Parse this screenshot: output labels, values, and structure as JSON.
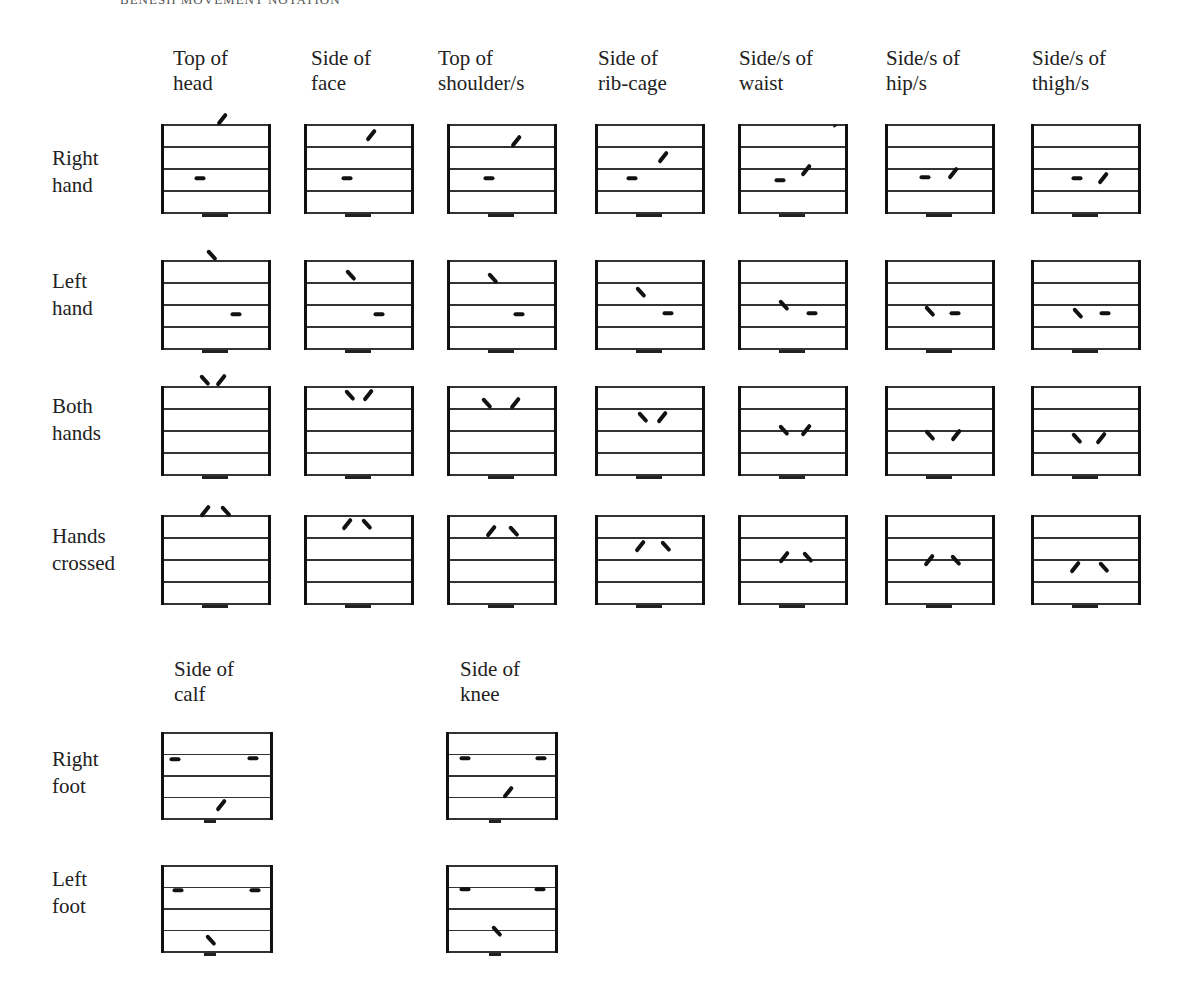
{
  "running_head": "BENESH MOVEMENT NOTATION",
  "hand_columns": [
    {
      "label": "Top of\nhead",
      "x": 162,
      "head_x": 173
    },
    {
      "label": "Side of\nface",
      "x": 305,
      "head_x": 311
    },
    {
      "label": "Top of\nshoulder/s",
      "x": 448,
      "head_x": 438
    },
    {
      "label": "Side of\nrib-cage",
      "x": 596,
      "head_x": 598
    },
    {
      "label": "Side/s of\nwaist",
      "x": 739,
      "head_x": 739
    },
    {
      "label": "Side/s of\nhip/s",
      "x": 886,
      "head_x": 886
    },
    {
      "label": "Side/s of\nthigh/s",
      "x": 1032,
      "head_x": 1032
    }
  ],
  "hand_rows": [
    {
      "label": "Right\nhand",
      "y": 125,
      "label_y": 145,
      "cells": [
        {
          "marks": [
            {
              "type": "dash",
              "x": 38,
              "y": 53
            },
            {
              "type": "slash",
              "x": 60,
              "y": -6
            }
          ]
        },
        {
          "marks": [
            {
              "type": "dash",
              "x": 42,
              "y": 53
            },
            {
              "type": "slash",
              "x": 66,
              "y": 10
            }
          ]
        },
        {
          "marks": [
            {
              "type": "dash",
              "x": 41,
              "y": 53
            },
            {
              "type": "slash",
              "x": 68,
              "y": 16
            }
          ]
        },
        {
          "marks": [
            {
              "type": "dash",
              "x": 36,
              "y": 53
            },
            {
              "type": "slash",
              "x": 67,
              "y": 32
            }
          ]
        },
        {
          "marks": [
            {
              "type": "dash",
              "x": 41,
              "y": 55
            },
            {
              "type": "slash",
              "x": 67,
              "y": 45
            },
            {
              "type": "tick",
              "x": 96,
              "y": 1
            }
          ]
        },
        {
          "marks": [
            {
              "type": "dash",
              "x": 39,
              "y": 52
            },
            {
              "type": "slash",
              "x": 67,
              "y": 48
            }
          ]
        },
        {
          "marks": [
            {
              "type": "dash",
              "x": 45,
              "y": 53
            },
            {
              "type": "slash",
              "x": 71,
              "y": 53
            }
          ]
        }
      ]
    },
    {
      "label": "Left\nhand",
      "y": 261,
      "label_y": 268,
      "cells": [
        {
          "marks": [
            {
              "type": "backslash",
              "x": 50,
              "y": -6
            },
            {
              "type": "dash",
              "x": 74,
              "y": 53
            }
          ]
        },
        {
          "marks": [
            {
              "type": "backslash",
              "x": 46,
              "y": 14
            },
            {
              "type": "dash",
              "x": 74,
              "y": 53
            }
          ]
        },
        {
          "marks": [
            {
              "type": "backslash",
              "x": 45,
              "y": 17
            },
            {
              "type": "dash",
              "x": 71,
              "y": 53
            }
          ]
        },
        {
          "marks": [
            {
              "type": "backslash",
              "x": 45,
              "y": 31
            },
            {
              "type": "dash",
              "x": 72,
              "y": 52
            }
          ]
        },
        {
          "marks": [
            {
              "type": "backslash",
              "x": 45,
              "y": 44
            },
            {
              "type": "dash",
              "x": 73,
              "y": 52
            }
          ]
        },
        {
          "marks": [
            {
              "type": "backslash",
              "x": 44,
              "y": 50
            },
            {
              "type": "dash",
              "x": 69,
              "y": 52
            }
          ]
        },
        {
          "marks": [
            {
              "type": "backslash",
              "x": 46,
              "y": 52
            },
            {
              "type": "dash",
              "x": 73,
              "y": 52
            }
          ]
        }
      ]
    },
    {
      "label": "Both\nhands",
      "y": 387,
      "label_y": 393,
      "cells": [
        {
          "marks": [
            {
              "type": "backslash",
              "x": 43,
              "y": -7
            },
            {
              "type": "slash",
              "x": 59,
              "y": -7
            }
          ]
        },
        {
          "marks": [
            {
              "type": "backslash",
              "x": 45,
              "y": 8
            },
            {
              "type": "slash",
              "x": 63,
              "y": 8
            }
          ]
        },
        {
          "marks": [
            {
              "type": "backslash",
              "x": 39,
              "y": 16
            },
            {
              "type": "slash",
              "x": 67,
              "y": 16
            }
          ]
        },
        {
          "marks": [
            {
              "type": "backslash",
              "x": 47,
              "y": 30
            },
            {
              "type": "slash",
              "x": 66,
              "y": 30
            }
          ]
        },
        {
          "marks": [
            {
              "type": "backslash",
              "x": 45,
              "y": 43
            },
            {
              "type": "slash",
              "x": 67,
              "y": 43
            }
          ]
        },
        {
          "marks": [
            {
              "type": "backslash",
              "x": 44,
              "y": 48
            },
            {
              "type": "slash",
              "x": 70,
              "y": 48
            }
          ]
        },
        {
          "marks": [
            {
              "type": "backslash",
              "x": 45,
              "y": 51
            },
            {
              "type": "slash",
              "x": 69,
              "y": 51
            }
          ]
        }
      ]
    },
    {
      "label": "Hands\ncrossed",
      "y": 516,
      "label_y": 523,
      "cells": [
        {
          "marks": [
            {
              "type": "slash",
              "x": 43,
              "y": -5
            },
            {
              "type": "backslash",
              "x": 64,
              "y": -5
            }
          ]
        },
        {
          "marks": [
            {
              "type": "slash",
              "x": 42,
              "y": 8
            },
            {
              "type": "backslash",
              "x": 62,
              "y": 8
            }
          ]
        },
        {
          "marks": [
            {
              "type": "slash",
              "x": 43,
              "y": 15
            },
            {
              "type": "backslash",
              "x": 66,
              "y": 15
            }
          ]
        },
        {
          "marks": [
            {
              "type": "slash",
              "x": 44,
              "y": 30
            },
            {
              "type": "backslash",
              "x": 70,
              "y": 30
            }
          ]
        },
        {
          "marks": [
            {
              "type": "slash",
              "x": 45,
              "y": 41
            },
            {
              "type": "backslash",
              "x": 69,
              "y": 41
            }
          ]
        },
        {
          "marks": [
            {
              "type": "slash",
              "x": 43,
              "y": 44
            },
            {
              "type": "backslash",
              "x": 70,
              "y": 44
            }
          ]
        },
        {
          "marks": [
            {
              "type": "slash",
              "x": 43,
              "y": 51
            },
            {
              "type": "backslash",
              "x": 72,
              "y": 51
            }
          ]
        }
      ]
    }
  ],
  "foot_columns": [
    {
      "label": "Side of\ncalf",
      "x": 162,
      "head_x": 174
    },
    {
      "label": "Side of\nknee",
      "x": 447,
      "head_x": 460
    }
  ],
  "foot_rows": [
    {
      "label": "Right\nfoot",
      "y": 733,
      "label_y": 746,
      "cells": [
        {
          "marks": [
            {
              "type": "dash",
              "x": 13,
              "y": 26
            },
            {
              "type": "dash",
              "x": 91,
              "y": 25
            },
            {
              "type": "slash",
              "x": 59,
              "y": 72
            }
          ]
        },
        {
          "marks": [
            {
              "type": "dash",
              "x": 18,
              "y": 25
            },
            {
              "type": "dash",
              "x": 94,
              "y": 25
            },
            {
              "type": "slash",
              "x": 61,
              "y": 59
            }
          ]
        }
      ]
    },
    {
      "label": "Left\nfoot",
      "y": 866,
      "label_y": 866,
      "cells": [
        {
          "marks": [
            {
              "type": "dash",
              "x": 16,
              "y": 24
            },
            {
              "type": "dash",
              "x": 93,
              "y": 24
            },
            {
              "type": "backslash",
              "x": 49,
              "y": 74
            }
          ]
        },
        {
          "marks": [
            {
              "type": "dash",
              "x": 18,
              "y": 23
            },
            {
              "type": "dash",
              "x": 93,
              "y": 23
            },
            {
              "type": "backslash",
              "x": 50,
              "y": 65
            }
          ]
        }
      ]
    }
  ],
  "layout": {
    "hand_head_y": 46,
    "foot_head_y": 657,
    "label_x": 52
  }
}
